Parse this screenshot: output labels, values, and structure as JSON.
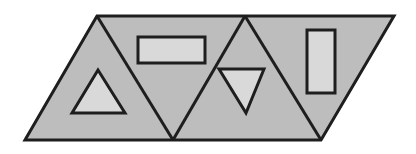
{
  "diagram": {
    "colors": {
      "fill": "#bdbdbd",
      "inner_fill": "#d9d9d9",
      "stroke": "#1e1e1e",
      "background": "#ffffff"
    },
    "parallelogram": {
      "points": "97,16 394,16 321,140 25,140"
    },
    "dividers": [
      {
        "points": "97,16 173,140"
      },
      {
        "points": "173,140 245,16"
      },
      {
        "points": "245,16 321,140"
      }
    ],
    "inner_shapes": [
      {
        "name": "triangle-up",
        "points": "98,70 72,113 125,113"
      },
      {
        "name": "rectangle-horizontal",
        "x": 138,
        "y": 37,
        "w": 67,
        "h": 26
      },
      {
        "name": "triangle-down",
        "points": "219,69 264,69 246,113"
      },
      {
        "name": "rectangle-vertical",
        "x": 307,
        "y": 30,
        "w": 28,
        "h": 63
      }
    ]
  }
}
